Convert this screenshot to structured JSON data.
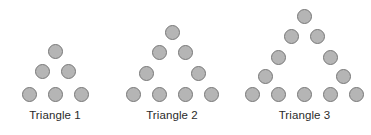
{
  "background_color": "#ffffff",
  "figure_style": {
    "dot_fill": "#b5b5b5",
    "dot_stroke": "#787878",
    "dot_diameter": 15,
    "label_color": "#2b2b2b"
  },
  "chart_data": {
    "type": "diagram",
    "title": "",
    "figures": [
      {
        "label": "Triangle 1",
        "term": 1,
        "left": 0,
        "width": 110,
        "label_y": 108,
        "dot_count": 6,
        "row_counts": [
          1,
          2,
          3
        ],
        "rows": [
          {
            "y": 44,
            "cx": [
              55
            ]
          },
          {
            "y": 64,
            "cx": [
              42,
              68
            ]
          },
          {
            "y": 87,
            "cx": [
              29,
              55,
              81
            ]
          }
        ]
      },
      {
        "label": "Triangle 2",
        "term": 2,
        "left": 113,
        "width": 118,
        "label_y": 108,
        "dot_count": 9,
        "row_counts": [
          1,
          2,
          2,
          4
        ],
        "rows": [
          {
            "y": 25,
            "cx": [
              59
            ]
          },
          {
            "y": 45,
            "cx": [
              46,
              72
            ]
          },
          {
            "y": 66,
            "cx": [
              33,
              85
            ]
          },
          {
            "y": 87,
            "cx": [
              20,
              46,
              72,
              98
            ]
          }
        ]
      },
      {
        "label": "Triangle 3",
        "term": 3,
        "left": 238,
        "width": 133,
        "label_y": 108,
        "dot_count": 12,
        "row_counts": [
          1,
          2,
          2,
          2,
          5
        ],
        "rows": [
          {
            "y": 9,
            "cx": [
              66
            ]
          },
          {
            "y": 29,
            "cx": [
              53,
              79
            ]
          },
          {
            "y": 50,
            "cx": [
              40,
              92
            ]
          },
          {
            "y": 69,
            "cx": [
              27,
              105
            ]
          },
          {
            "y": 87,
            "cx": [
              14,
              40,
              66,
              92,
              118
            ]
          }
        ]
      }
    ]
  }
}
